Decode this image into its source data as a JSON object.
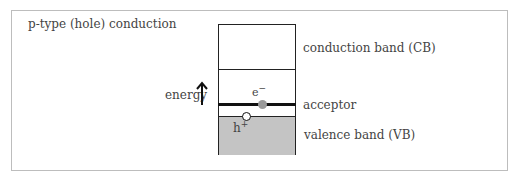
{
  "title": "p-type (hole) conduction",
  "axis": {
    "label": "energy",
    "arrow_icon": "up-arrow"
  },
  "bands": {
    "conduction": "conduction band (CB)",
    "acceptor": "acceptor",
    "valence": "valence band (VB)"
  },
  "carriers": {
    "electron": {
      "base": "e",
      "sup": "−"
    },
    "hole": {
      "base": "h",
      "sup": "+"
    }
  },
  "colors": {
    "valence_fill": "#c4c4c4",
    "electron_dot": "#9a9a9a",
    "hole_dot": "#ffffff",
    "lines": "#222222"
  }
}
